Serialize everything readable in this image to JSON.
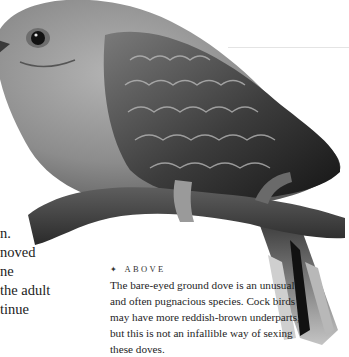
{
  "page": {
    "body_text_fragments": [
      "n.",
      "noved",
      "ne",
      "the adult",
      "tinue"
    ],
    "photo": {
      "subject": "bare-eyed ground dove perched on branch",
      "style": "greyscale"
    },
    "caption": {
      "marker_icon": "four-point-star",
      "label": "ABOVE",
      "lines": [
        "The bare-eyed ground dove is an unusual",
        "and often pugnacious species. Cock birds",
        "may have more reddish-brown underparts,",
        "but this is not an infallible way of sexing",
        "these doves."
      ]
    }
  }
}
